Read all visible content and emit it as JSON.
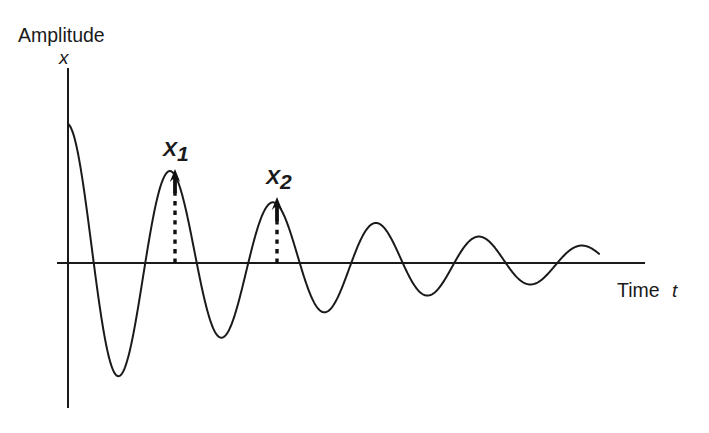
{
  "figure": {
    "name": "damped-oscillation-decay",
    "background_color": "#ffffff",
    "line_color": "#1a1a1a"
  },
  "labels": {
    "y_axis_title": "Amplitude",
    "y_axis_variable": "x",
    "x_axis_title": "Time",
    "x_axis_variable": "t",
    "peak_1": "X",
    "peak_1_subscript": "1",
    "peak_2": "X",
    "peak_2_subscript": "2"
  },
  "chart_data": {
    "type": "line",
    "title": "",
    "xlabel": "Time t",
    "ylabel": "Amplitude x",
    "grid": false,
    "legend": null,
    "model": {
      "equation": "x(t) = A * exp(-zeta * t) * cos(2*pi*t/T)",
      "initial_amplitude_px": 139,
      "decay_per_period": 0.66,
      "period_px": 103.0,
      "phase": "cosine (starts at positive maximum on the y-axis)"
    },
    "axes_pixels": {
      "origin_x": 68,
      "origin_y": 263,
      "y_axis_top": 68,
      "y_axis_bottom": 408,
      "x_axis_left": 57,
      "x_axis_right": 645,
      "curve_start_x": 68,
      "curve_end_x": 599
    },
    "peaks": [
      {
        "index": 0,
        "x": 68,
        "y": 124,
        "amplitude_px": 139,
        "labeled": false
      },
      {
        "index": 1,
        "x": 175,
        "y": 167,
        "amplitude_px": 96,
        "labeled": true,
        "label": "X1"
      },
      {
        "index": 2,
        "x": 277,
        "y": 195,
        "amplitude_px": 68,
        "labeled": true,
        "label": "X2"
      },
      {
        "index": 3,
        "x": 378,
        "y": 216,
        "amplitude_px": 47,
        "labeled": false
      },
      {
        "index": 4,
        "x": 482,
        "y": 233,
        "amplitude_px": 30,
        "labeled": false
      },
      {
        "index": 5,
        "x": 585,
        "y": 243,
        "amplitude_px": 20,
        "labeled": false
      }
    ],
    "troughs": [
      {
        "index": 1,
        "x": 122,
        "y": 405,
        "amplitude_px": -142
      },
      {
        "index": 2,
        "x": 226,
        "y": 368,
        "amplitude_px": -105
      },
      {
        "index": 3,
        "x": 330,
        "y": 345,
        "amplitude_px": -82
      },
      {
        "index": 4,
        "x": 432,
        "y": 310,
        "amplitude_px": -47
      },
      {
        "index": 5,
        "x": 537,
        "y": 295,
        "amplitude_px": -32
      }
    ],
    "zero_crossings_px": [
      98,
      148,
      200,
      250,
      303,
      354,
      406,
      458,
      510,
      562
    ],
    "markers": [
      {
        "name": "X1",
        "x": 175,
        "top_y": 169,
        "base_y": 263
      },
      {
        "name": "X2",
        "x": 277,
        "top_y": 197,
        "base_y": 263
      }
    ]
  }
}
